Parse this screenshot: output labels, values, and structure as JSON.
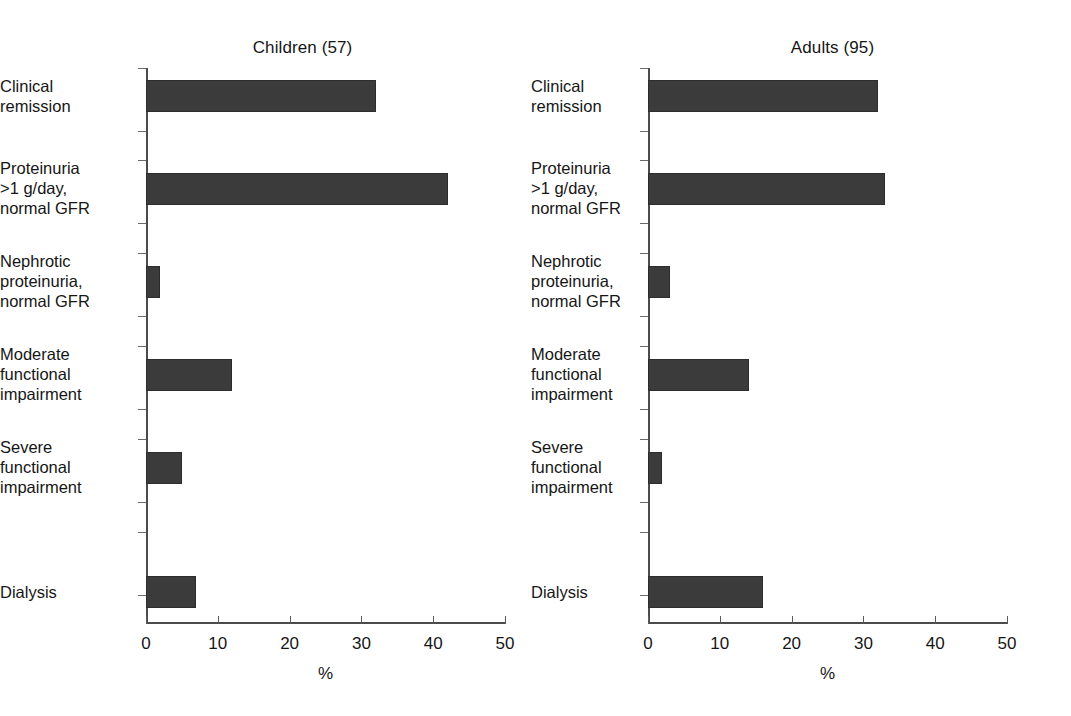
{
  "figure": {
    "background_color": "#ffffff",
    "bar_color": "#3b3b3b",
    "axis_color": "#4b4b4b"
  },
  "chart_data": [
    {
      "type": "bar",
      "orientation": "horizontal",
      "title": "Children (57)",
      "xlabel": "%",
      "ylabel": "",
      "xlim": [
        0,
        50
      ],
      "xticks": [
        0,
        10,
        20,
        30,
        40,
        50
      ],
      "xtick_labels": [
        "0",
        "10",
        "20",
        "30",
        "40",
        "50"
      ],
      "grid": false,
      "legend": null,
      "categories": [
        "Clinical\nremission",
        "Proteinuria\n>1 g/day,\nnormal GFR",
        "Nephrotic\nproteinuria,\nnormal GFR",
        "Moderate\nfunctional\nimpairment",
        "Severe\nfunctional\nimpairment",
        "Dialysis"
      ],
      "values": [
        32,
        42,
        2,
        12,
        5,
        7
      ]
    },
    {
      "type": "bar",
      "orientation": "horizontal",
      "title": "Adults (95)",
      "xlabel": "%",
      "ylabel": "",
      "xlim": [
        0,
        50
      ],
      "xticks": [
        0,
        10,
        20,
        30,
        40,
        50
      ],
      "xtick_labels": [
        "0",
        "10",
        "20",
        "30",
        "40",
        "50"
      ],
      "grid": false,
      "legend": null,
      "categories": [
        "Clinical\nremission",
        "Proteinuria\n>1 g/day,\nnormal GFR",
        "Nephrotic\nproteinuria,\nnormal GFR",
        "Moderate\nfunctional\nimpairment",
        "Severe\nfunctional\nimpairment",
        "Dialysis"
      ],
      "values": [
        32,
        33,
        3,
        14,
        2,
        16
      ]
    }
  ]
}
